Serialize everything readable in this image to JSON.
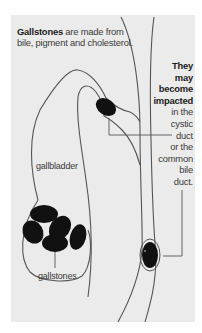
{
  "intro": {
    "bold": "Gallstones",
    "rest_line1": " are made from",
    "line2": "bile, pigment and cholesterol."
  },
  "callout": {
    "bold_lines": [
      "They",
      "may",
      "become",
      "impacted"
    ],
    "lines": [
      "in the",
      "cystic",
      "duct",
      "or the",
      "common",
      "bile",
      "duct."
    ]
  },
  "labels": {
    "gallbladder": "gallbladder",
    "gallstones": "gallstones"
  },
  "colors": {
    "panel": "#ebebeb",
    "outline": "#555555",
    "stone": "#111111",
    "text": "#3a3a3a"
  }
}
